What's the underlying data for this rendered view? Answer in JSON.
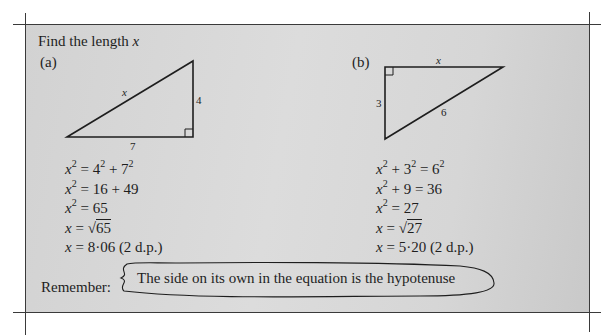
{
  "title": {
    "text": "Find the length ",
    "variable": "x"
  },
  "part_a": {
    "label": "(a)",
    "triangle": {
      "hypotenuse_label": "x",
      "vertical_side_label": "4",
      "horizontal_side_label": "7",
      "right_angle": "bottom-right"
    },
    "steps": [
      {
        "lhs": "x",
        "lhs_sup": "2",
        "rhs": "= 4",
        "rhs_sup1": "2",
        "rhs_mid": " + 7",
        "rhs_sup2": "2"
      },
      {
        "lhs": "x",
        "lhs_sup": "2",
        "rhs": "= 16 + 49"
      },
      {
        "lhs": "x",
        "lhs_sup": "2",
        "rhs": "= 65"
      },
      {
        "lhs": "x",
        "rhs": "= ",
        "sqrt": "65"
      },
      {
        "lhs": "x",
        "rhs": "= 8·06 (2 d.p.)"
      }
    ]
  },
  "part_b": {
    "label": "(b)",
    "triangle": {
      "top_side_label": "x",
      "vertical_side_label": "3",
      "hypotenuse_label": "6",
      "right_angle": "top-left"
    },
    "steps": [
      {
        "lhs": "x",
        "lhs_sup": "2",
        "rhs": " + 3",
        "rhs_sup1": "2",
        "rhs_mid": " = 6",
        "rhs_sup2": "2"
      },
      {
        "lhs": "x",
        "lhs_sup": "2",
        "rhs": " + 9 = 36"
      },
      {
        "lhs": "x",
        "lhs_sup": "2",
        "rhs": " = 27"
      },
      {
        "lhs": "x",
        "rhs": " = ",
        "sqrt": "27"
      },
      {
        "lhs": "x",
        "rhs": " = 5·20 (2 d.p.)"
      }
    ]
  },
  "remember": {
    "label": "Remember:",
    "note": "The side on its own in the equation is the hypotenuse"
  },
  "colors": {
    "panel": "#d6d6d6",
    "ink": "#1e1e1e",
    "rule": "#3a3a3a"
  }
}
